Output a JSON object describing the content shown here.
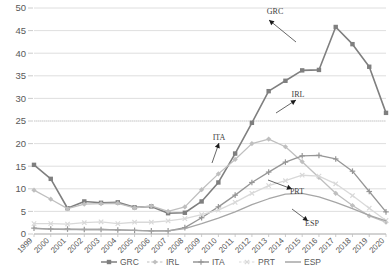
{
  "chart_data": {
    "type": "line",
    "title": "",
    "xlabel": "",
    "ylabel": "",
    "ylim": [
      0,
      50
    ],
    "ytick_step": 5,
    "grid": true,
    "legend_position": "bottom",
    "yticks": [
      "0",
      "5",
      "10",
      "15",
      "20",
      "25",
      "30",
      "35",
      "40",
      "45",
      "50"
    ],
    "categories": [
      "1999",
      "2000",
      "2001",
      "2002",
      "2003",
      "2004",
      "2005",
      "2006",
      "2007",
      "2008",
      "2009",
      "2010",
      "2011",
      "2012",
      "2013",
      "2014",
      "2015",
      "2016",
      "2017",
      "2018",
      "2019",
      "2020"
    ],
    "series": [
      {
        "name": "GRC",
        "color": "#7f7f7f",
        "marker": "square",
        "values": [
          15.3,
          12.2,
          5.7,
          7.2,
          6.9,
          7.0,
          5.9,
          6.1,
          4.6,
          4.7,
          7.2,
          11.4,
          17.8,
          24.6,
          31.6,
          33.9,
          36.2,
          36.3,
          45.8,
          42.0,
          37.0,
          26.8
        ]
      },
      {
        "name": "IRL",
        "color": "#bfbfbf",
        "marker": "diamond",
        "values": [
          9.7,
          7.7,
          5.6,
          6.6,
          6.7,
          6.8,
          5.8,
          6.2,
          5.0,
          6.0,
          9.8,
          13.3,
          16.5,
          20.0,
          21.0,
          19.3,
          16.0,
          12.5,
          9.0,
          6.3,
          4.0,
          2.6
        ]
      },
      {
        "name": "ITA",
        "color": "#969696",
        "marker": "cross",
        "values": [
          1.3,
          1.1,
          1.1,
          1.0,
          1.0,
          0.9,
          0.8,
          0.7,
          0.7,
          1.4,
          3.6,
          6.0,
          8.6,
          11.4,
          13.7,
          15.9,
          17.3,
          17.4,
          16.6,
          13.9,
          9.4,
          4.9
        ]
      },
      {
        "name": "PRT",
        "color": "#d9d9d9",
        "marker": "x",
        "values": [
          2.3,
          2.3,
          2.2,
          2.5,
          2.7,
          2.3,
          2.6,
          2.6,
          2.9,
          3.4,
          4.3,
          5.3,
          7.0,
          9.0,
          10.7,
          11.8,
          13.0,
          12.8,
          11.1,
          8.5,
          5.7,
          3.0
        ]
      },
      {
        "name": "ESP",
        "color": "#a6a6a6",
        "marker": "none",
        "values": [
          1.2,
          1.1,
          1.0,
          1.0,
          1.0,
          0.9,
          0.8,
          0.7,
          0.7,
          1.2,
          2.3,
          3.5,
          4.9,
          6.5,
          7.8,
          8.8,
          9.0,
          8.2,
          7.0,
          5.6,
          4.1,
          2.9
        ]
      }
    ],
    "annotations": [
      {
        "label": "GRC",
        "x": 275,
        "y": 14,
        "ax": 269,
        "ay": 20,
        "tx": 296,
        "ty": 42
      },
      {
        "label": "IRL",
        "x": 298,
        "y": 97,
        "ax": 296,
        "ay": 100,
        "tx": 276,
        "ty": 113
      },
      {
        "label": "ITA",
        "x": 219,
        "y": 140,
        "ax": 219,
        "ay": 143,
        "tx": 212,
        "ty": 163
      },
      {
        "label": "PRT",
        "x": 297,
        "y": 194,
        "ax": 292,
        "ay": 189,
        "tx": 268,
        "ty": 180
      },
      {
        "label": "ESP",
        "x": 312,
        "y": 226,
        "ax": 308,
        "ay": 221,
        "tx": 292,
        "ty": 209
      }
    ]
  },
  "legend": {
    "items": [
      {
        "label": "GRC",
        "color": "#7f7f7f",
        "marker": "square"
      },
      {
        "label": "IRL",
        "color": "#bfbfbf",
        "marker": "diamond"
      },
      {
        "label": "ITA",
        "color": "#969696",
        "marker": "cross"
      },
      {
        "label": "PRT",
        "color": "#d9d9d9",
        "marker": "x"
      },
      {
        "label": "ESP",
        "color": "#a6a6a6",
        "marker": "none"
      }
    ]
  }
}
